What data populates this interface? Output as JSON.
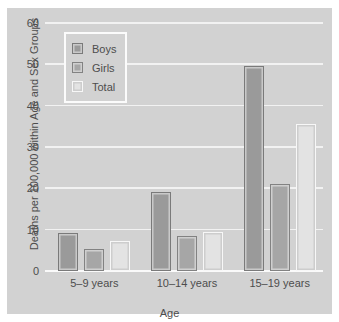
{
  "chart_data": {
    "type": "bar",
    "title": "",
    "xlabel": "Age",
    "ylabel": "Deaths per 100,000 within Age and Sex Groups",
    "categories": [
      "5–9 years",
      "10–14 years",
      "15–19 years"
    ],
    "series": [
      {
        "name": "Boys",
        "values": [
          9.2,
          19.0,
          49.5
        ],
        "color": "#9a9a9a"
      },
      {
        "name": "Girls",
        "values": [
          5.3,
          8.4,
          21.0
        ],
        "color": "#a6a6a6"
      },
      {
        "name": "Total",
        "values": [
          7.3,
          9.4,
          35.5
        ],
        "color": "#e3e3e3"
      }
    ],
    "ylim": [
      0,
      60
    ],
    "yticks": [
      "0",
      "10",
      "20",
      "30",
      "40",
      "50",
      "60"
    ],
    "grid": true,
    "legend_position": "upper left",
    "background_color": "#d2d2d2",
    "gridline_color": "#f2f2f2"
  },
  "legend": {
    "items": [
      {
        "label": "Boys"
      },
      {
        "label": "Girls"
      },
      {
        "label": "Total"
      }
    ]
  }
}
